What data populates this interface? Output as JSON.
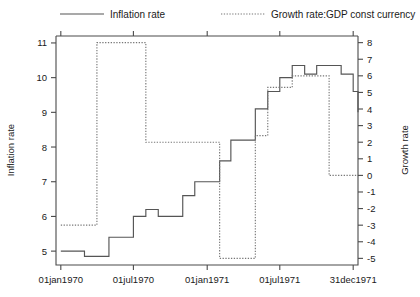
{
  "chart_data": {
    "type": "line",
    "title": "",
    "subtitle": "",
    "xlabel": "",
    "ylabel": "Inflation rate",
    "y2label": "Growth rate",
    "step_style": "post",
    "grid": false,
    "legend_position": "top",
    "x_tick_labels": [
      "01jan1970",
      "01jul1970",
      "01jan1971",
      "01jul1971",
      "31dec1971"
    ],
    "x_tick_values": [
      0,
      181,
      365,
      546,
      729
    ],
    "xlim": [
      -12,
      741
    ],
    "ylim": [
      4.6,
      11.2
    ],
    "y_tick_labels": [
      "5",
      "6",
      "7",
      "8",
      "9",
      "10",
      "11"
    ],
    "y_tick_values": [
      5,
      6,
      7,
      8,
      9,
      10,
      11
    ],
    "y2lim": [
      -5.4,
      8.4
    ],
    "y2_tick_labels": [
      "-5",
      "-4",
      "-3",
      "-2",
      "-1",
      "0",
      "1",
      "2",
      "3",
      "4",
      "5",
      "6",
      "7",
      "8"
    ],
    "y2_tick_values": [
      -5,
      -4,
      -3,
      -2,
      -1,
      0,
      1,
      2,
      3,
      4,
      5,
      6,
      7,
      8
    ],
    "series": [
      {
        "name": "Inflation rate",
        "axis": "left",
        "style": "solid",
        "color": "#555555",
        "x": [
          0,
          31,
          59,
          90,
          120,
          151,
          181,
          212,
          243,
          273,
          304,
          334,
          365,
          396,
          424,
          455,
          485,
          516,
          546,
          577,
          608,
          638,
          669,
          699,
          729
        ],
        "values": [
          5.0,
          5.0,
          4.85,
          4.85,
          5.4,
          5.4,
          6.0,
          6.2,
          6.0,
          6.0,
          6.6,
          7.0,
          7.0,
          7.6,
          8.2,
          8.2,
          9.1,
          9.6,
          10.0,
          10.35,
          10.1,
          10.35,
          10.35,
          10.1,
          9.6
        ]
      },
      {
        "name": "Growth rate:GDP const currency",
        "axis": "right",
        "style": "dotted",
        "color": "#777777",
        "x": [
          0,
          31,
          59,
          90,
          120,
          151,
          181,
          212,
          243,
          273,
          304,
          334,
          365,
          396,
          424,
          455,
          485,
          516,
          546,
          577,
          608,
          638,
          669,
          699,
          729
        ],
        "values": [
          -3.0,
          -3.0,
          -3.0,
          8.0,
          8.0,
          8.0,
          8.0,
          2.0,
          2.0,
          2.0,
          2.0,
          2.0,
          2.0,
          -5.0,
          -5.0,
          -5.0,
          2.4,
          5.3,
          5.3,
          6.0,
          6.0,
          6.0,
          0.0,
          0.0,
          0.0
        ]
      }
    ],
    "tail_values": {
      "inflation_final": 9.0,
      "growth_final": 0.0
    }
  },
  "legend": {
    "items": [
      {
        "label": "Inflation rate",
        "style": "solid"
      },
      {
        "label": "Growth rate:GDP const currency",
        "style": "dotted"
      }
    ]
  }
}
